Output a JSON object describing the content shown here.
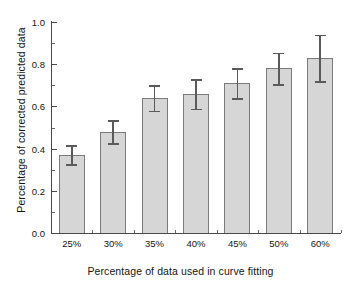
{
  "chart_data": {
    "type": "bar",
    "title": "",
    "xlabel": "Percentage of data used in curve fitting",
    "ylabel": "Percentage of corrected predicted data",
    "categories": [
      "25%",
      "30%",
      "35%",
      "40%",
      "45%",
      "50%",
      "60%"
    ],
    "values": [
      0.37,
      0.48,
      0.64,
      0.66,
      0.71,
      0.78,
      0.83
    ],
    "errors": [
      0.045,
      0.055,
      0.06,
      0.07,
      0.07,
      0.075,
      0.11
    ],
    "ylim": [
      0.0,
      1.0
    ],
    "ytick_labels": [
      "0.0",
      "0.2",
      "0.4",
      "0.6",
      "0.8",
      "1.0"
    ],
    "ytick_values": [
      0.0,
      0.2,
      0.4,
      0.6,
      0.8,
      1.0
    ],
    "yminor_values": [
      0.1,
      0.3,
      0.5,
      0.7,
      0.9
    ],
    "grid": false,
    "legend": false,
    "legend_position": "none",
    "bar_fill_color": "#d6d6d6",
    "bar_edge_color": "#7b7b7b",
    "error_bar_color": "#5a5a5a",
    "axis_color": "#4a4a4a",
    "background_color": "#ffffff"
  }
}
